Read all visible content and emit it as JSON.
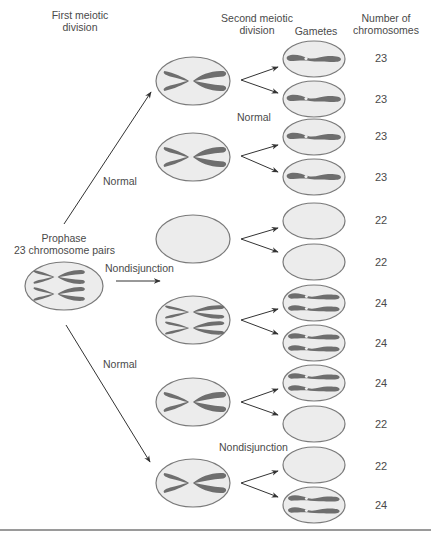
{
  "headers": {
    "first_division": [
      "First meiotic",
      "division"
    ],
    "second_division": [
      "Second meiotic",
      "division"
    ],
    "gametes": "Gametes",
    "num_chromosomes": [
      "Number of",
      "chromosomes"
    ]
  },
  "prophase": {
    "title": "Prophase",
    "subtitle": "23 chromosome pairs"
  },
  "labels": {
    "normal_top": "Normal",
    "normal_second": "Normal",
    "nondisjunction_first": "Nondisjunction",
    "normal_bottom": "Normal",
    "nondisjunction_second": "Nondisjunction"
  },
  "gamete_counts": [
    "23",
    "23",
    "23",
    "23",
    "22",
    "22",
    "24",
    "24",
    "24",
    "22",
    "22",
    "24"
  ],
  "colors": {
    "cell_fill": "#ececec",
    "cell_stroke": "#7a7a7a",
    "chromosome": "#6e6e6e",
    "arrow": "#333333",
    "rule": "#9a9a9a"
  }
}
